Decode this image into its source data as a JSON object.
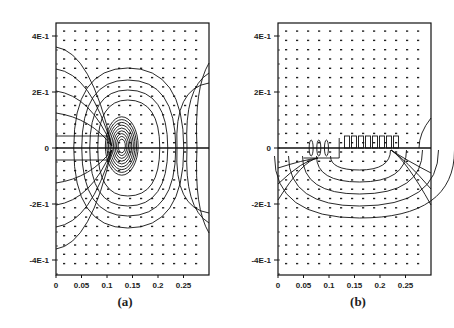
{
  "chart_data": [
    {
      "type": "heatmap",
      "subtype": "contour-with-vector-grid",
      "panel_label": "(a)",
      "title": "",
      "xlabel": "",
      "ylabel": "",
      "xlim": [
        0,
        0.3
      ],
      "ylim": [
        -0.45,
        0.45
      ],
      "x_ticks": [
        "0",
        "0.05",
        "0.1",
        "0.15",
        "0.2",
        "0.25"
      ],
      "y_ticks": [
        "4E-1",
        "2E-1",
        "0",
        "-2E-1",
        "-4E-1"
      ],
      "y_tick_values": [
        0.4,
        0.2,
        0,
        -0.2,
        -0.4
      ],
      "grid": false,
      "features": {
        "horizontal_line_y": 0,
        "concentration_center_x": 0.125,
        "contour_extent_y": [
          -0.25,
          0.25
        ],
        "symmetry": "approximately symmetric about y=0"
      }
    },
    {
      "type": "heatmap",
      "subtype": "contour-with-vector-grid",
      "panel_label": "(b)",
      "title": "",
      "xlabel": "",
      "ylabel": "",
      "xlim": [
        0,
        0.3
      ],
      "ylim": [
        -0.45,
        0.45
      ],
      "x_ticks": [
        "0",
        "0.05",
        "0.1",
        "0.15",
        "0.2",
        "0.25"
      ],
      "y_ticks": [
        "4E-1",
        "2E-1",
        "0",
        "-2E-1",
        "-4E-1"
      ],
      "y_tick_values": [
        0.4,
        0.2,
        0,
        -0.2,
        -0.4
      ],
      "grid": false,
      "features": {
        "horizontal_line_y": 0,
        "concentration_center_x": 0.15,
        "contour_extent_y": [
          -0.22,
          0.05
        ],
        "symmetry": "contours mainly below y=0"
      }
    }
  ],
  "panels": [
    {
      "label": "(a)"
    },
    {
      "label": "(b)"
    }
  ],
  "axes": {
    "x_ticks": [
      "0",
      "0.05",
      "0.1",
      "0.15",
      "0.2",
      "0.25"
    ],
    "y_ticks": [
      "4E-1",
      "2E-1",
      "0",
      "-2E-1",
      "-4E-1"
    ]
  }
}
